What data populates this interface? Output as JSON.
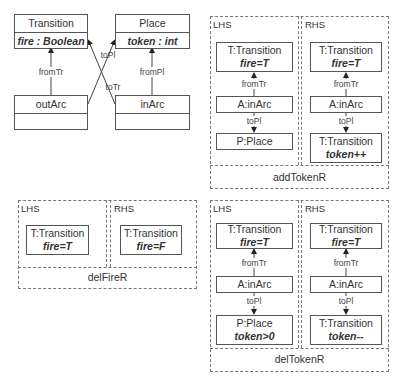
{
  "metamodel": {
    "classes": [
      {
        "name": "Transition",
        "attribute": "fire : Boolean"
      },
      {
        "name": "Place",
        "attribute": "token : int"
      },
      {
        "name": "outArc",
        "attribute": ""
      },
      {
        "name": "inArc",
        "attribute": ""
      }
    ],
    "edges": {
      "fromTr": "fromTr",
      "fromPl": "fromPl",
      "toPl": "toPl",
      "toTr": "toTr"
    }
  },
  "rules": {
    "addTokenR": {
      "name": "addTokenR",
      "lhs": {
        "label": "LHS",
        "nodes": [
          {
            "name": "T:Transition",
            "attr": "fire=T"
          },
          {
            "name": "A:inArc",
            "attr": ""
          },
          {
            "name": "P:Place",
            "attr": ""
          }
        ],
        "edges": [
          "fromTr",
          "toPl"
        ]
      },
      "rhs": {
        "label": "RHS",
        "nodes": [
          {
            "name": "T:Transition",
            "attr": "fire=T"
          },
          {
            "name": "A:inArc",
            "attr": ""
          },
          {
            "name": "T:Transition",
            "attr": "token++"
          }
        ],
        "edges": [
          "fromTr",
          "toPl"
        ]
      }
    },
    "delFireR": {
      "name": "delFireR",
      "lhs": {
        "label": "LHS",
        "nodes": [
          {
            "name": "T:Transition",
            "attr": "fire=T"
          }
        ]
      },
      "rhs": {
        "label": "RHS",
        "nodes": [
          {
            "name": "T:Transition",
            "attr": "fire=F"
          }
        ]
      }
    },
    "delTokenR": {
      "name": "delTokenR",
      "lhs": {
        "label": "LHS",
        "nodes": [
          {
            "name": "T:Transition",
            "attr": "fire=T"
          },
          {
            "name": "A:inArc",
            "attr": ""
          },
          {
            "name": "P:Place",
            "attr": "token>0"
          }
        ],
        "edges": [
          "fromTr",
          "toPl"
        ]
      },
      "rhs": {
        "label": "RHS",
        "nodes": [
          {
            "name": "T:Transition",
            "attr": "fire=T"
          },
          {
            "name": "A:inArc",
            "attr": ""
          },
          {
            "name": "T:Transition",
            "attr": "token--"
          }
        ],
        "edges": [
          "fromTr",
          "toPl"
        ]
      }
    }
  }
}
